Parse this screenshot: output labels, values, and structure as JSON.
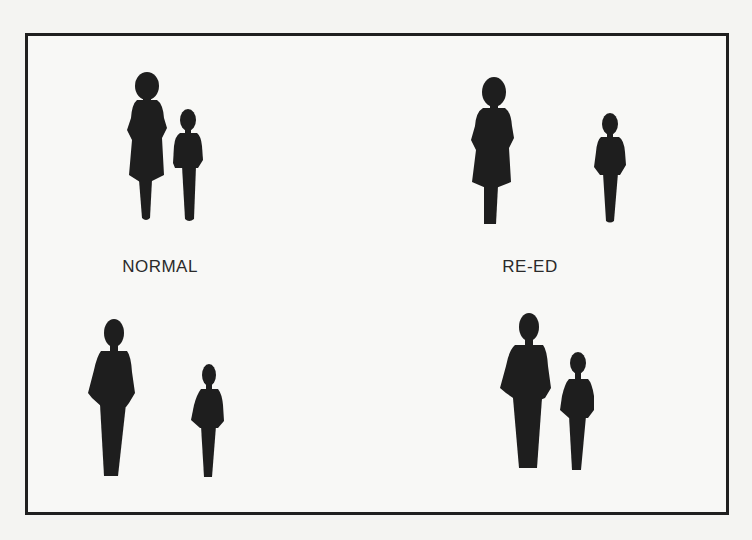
{
  "panels": [
    {
      "id": "normal-mother-child",
      "label": "NORMAL",
      "figures": [
        "adult-female",
        "child"
      ]
    },
    {
      "id": "reed-mother-child",
      "label": "RE-ED",
      "figures": [
        "adult-female",
        "child"
      ]
    },
    {
      "id": "normal-father-child",
      "label": "",
      "figures": [
        "adult-male",
        "child"
      ]
    },
    {
      "id": "reed-father-child",
      "label": "",
      "figures": [
        "adult-male",
        "child"
      ]
    }
  ],
  "labels": {
    "left": "NORMAL",
    "right": "RE-ED"
  },
  "colors": {
    "silhouette": "#1e1e1e",
    "frame": "#1f1f1f",
    "background": "#f8f8f6"
  }
}
